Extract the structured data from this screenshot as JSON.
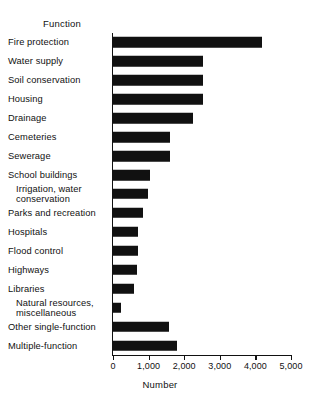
{
  "chart_data": {
    "type": "bar",
    "orientation": "horizontal",
    "title": "",
    "xlabel": "Number",
    "ylabel": "Function",
    "category_header": "Function",
    "xlim": [
      0,
      5000
    ],
    "xticks": [
      0,
      1000,
      2000,
      3000,
      4000,
      5000
    ],
    "xticklabels": [
      "0",
      "1,000",
      "2,000",
      "3,000",
      "4,000",
      "5,000"
    ],
    "grid": false,
    "legend": false,
    "bar_color": "#111111",
    "categories": [
      "Fire protection",
      "Water supply",
      "Soil conservation",
      "Housing",
      "Drainage",
      "Cemeteries",
      "Sewerage",
      "School buildings",
      "Irrigation, water\nconservation",
      "Parks and recreation",
      "Hospitals",
      "Flood control",
      "Highways",
      "Libraries",
      "Natural resources,\nmiscellaneous",
      "Other single-function",
      "Multiple-function"
    ],
    "values": [
      4190,
      2520,
      2520,
      2520,
      2235,
      1615,
      1615,
      1050,
      975,
      835,
      715,
      700,
      665,
      600,
      225,
      1560,
      1790
    ]
  }
}
